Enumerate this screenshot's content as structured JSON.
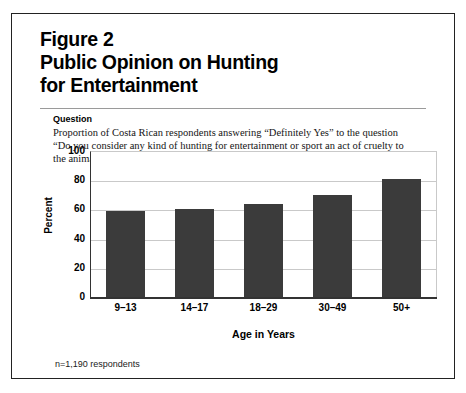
{
  "figure": {
    "number": "Figure 2",
    "title_line1": "Public Opinion on Hunting",
    "title_line2": "for Entertainment",
    "question_label": "Question",
    "question_text": "Proportion of Costa Rican respondents answering “Definitely Yes” to the question “Do you consider any kind of hunting for entertainment or sport an act of cruelty to the animals?” by age group.",
    "footnote": "n=1,190 respondents",
    "border_color": "#222222",
    "bar_color": "#3b3b3b",
    "gridline_color": "#c9c9c9",
    "axis_color": "#333333"
  },
  "chart_data": {
    "type": "bar",
    "title": "Public Opinion on Hunting for Entertainment",
    "categories": [
      "9–13",
      "14–17",
      "18–29",
      "30–49",
      "50+"
    ],
    "values": [
      59,
      60,
      64,
      70,
      81
    ],
    "xlabel": "Age in Years",
    "ylabel": "Percent",
    "ylim": [
      0,
      100
    ],
    "yticks": [
      0,
      20,
      40,
      60,
      80,
      100
    ],
    "ytick_labels": [
      "0",
      "20",
      "40",
      "60",
      "80",
      "100"
    ],
    "grid": true,
    "legend": false,
    "series": [
      {
        "name": "Definitely Yes",
        "values": [
          59,
          60,
          64,
          70,
          81
        ]
      }
    ]
  }
}
